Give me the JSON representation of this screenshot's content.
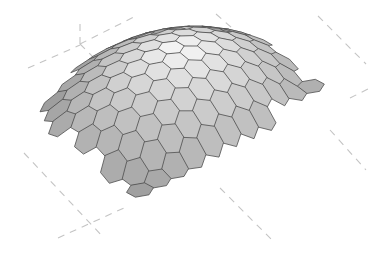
{
  "scene": {
    "width": 386,
    "height": 257,
    "background": "#ffffff",
    "subject": "hexagonal-panel curved shell surface",
    "cell_stroke": "#4e4e4e",
    "highlight_color": "#f6f6f6",
    "shadow_color": "#8a8a8a",
    "guide_color": "#c4c4c4"
  },
  "guides": [
    {
      "name": "guide-axis-top-left-horizontal",
      "x1": 28,
      "y1": 68,
      "x2": 80,
      "y2": 45
    },
    {
      "name": "guide-axis-top-left-vertical",
      "x1": 80,
      "y1": 24,
      "x2": 80,
      "y2": 44
    },
    {
      "name": "guide-axis-top-left-rising",
      "x1": 80,
      "y1": 44,
      "x2": 136,
      "y2": 16
    },
    {
      "name": "guide-axis-top-left-descending",
      "x1": 80,
      "y1": 44,
      "x2": 118,
      "y2": 82
    },
    {
      "name": "guide-axis-top-right-a",
      "x1": 216,
      "y1": 14,
      "x2": 232,
      "y2": 28
    },
    {
      "name": "guide-axis-top-right-b",
      "x1": 318,
      "y1": 16,
      "x2": 366,
      "y2": 64
    },
    {
      "name": "guide-axis-right-short",
      "x1": 350,
      "y1": 98,
      "x2": 370,
      "y2": 88
    },
    {
      "name": "guide-axis-right-descending",
      "x1": 330,
      "y1": 130,
      "x2": 366,
      "y2": 170
    },
    {
      "name": "guide-axis-bottom-right",
      "x1": 220,
      "y1": 188,
      "x2": 272,
      "y2": 240
    },
    {
      "name": "guide-axis-bottom-left-diagonal",
      "x1": 24,
      "y1": 153,
      "x2": 104,
      "y2": 238
    },
    {
      "name": "guide-axis-bottom-left-cross",
      "x1": 58,
      "y1": 238,
      "x2": 126,
      "y2": 207
    }
  ],
  "surface": {
    "rows": 10,
    "cols": 11,
    "origin": [
      210,
      150
    ],
    "u_vec": [
      17.5,
      -9.2
    ],
    "v_vec": [
      -15.0,
      -8.0
    ],
    "dome_height": 58,
    "cell_radius": 0.52
  }
}
